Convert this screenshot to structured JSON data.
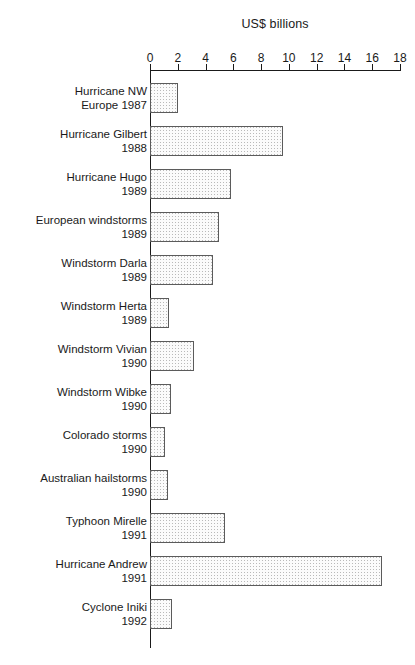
{
  "chart_data": {
    "type": "bar",
    "orientation": "horizontal",
    "title": "US$ billions",
    "xlabel": "US$ billions",
    "ylabel": "",
    "xlim": [
      0,
      18
    ],
    "xticks": [
      0,
      2,
      4,
      6,
      8,
      10,
      12,
      14,
      16,
      18
    ],
    "xtick_labels": [
      "0",
      "2",
      "4",
      "6",
      "8",
      "10",
      "12",
      "14",
      "16",
      "18"
    ],
    "grid": false,
    "legend": null,
    "axis_position": "top",
    "categories": [
      "Hurricane NW\nEurope 1987",
      "Hurricane Gilbert\n1988",
      "Hurricane Hugo\n1989",
      "European windstorms\n1989",
      "Windstorm Darla\n1989",
      "Windstorm Herta\n1989",
      "Windstorm Vivian\n1990",
      "Windstorm Wibke\n1990",
      "Colorado storms\n1990",
      "Australian hailstorms\n1990",
      "Typhoon Mirelle\n1991",
      "Hurricane Andrew\n1991",
      "Cyclone Iniki\n1992"
    ],
    "values": [
      2.0,
      9.6,
      5.8,
      5.0,
      4.5,
      1.4,
      3.2,
      1.5,
      1.1,
      1.3,
      5.4,
      16.7,
      1.6
    ],
    "bar_fill": "#fbfbfb",
    "bar_pattern": "stipple-dots",
    "bar_edge_color": "#5b5b5b",
    "axis_color": "#1a1a1a"
  }
}
